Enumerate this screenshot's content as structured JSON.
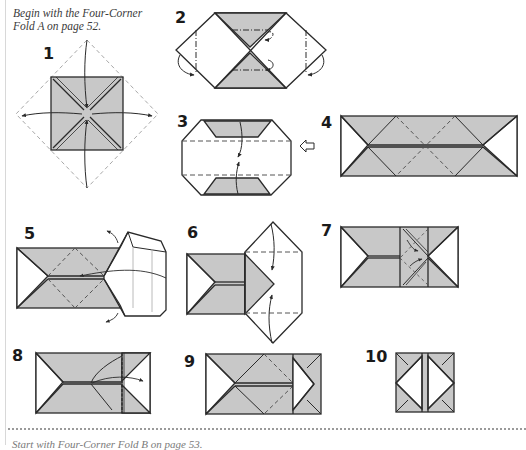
{
  "page": {
    "intro_line1": "Begin with the Four-Corner",
    "intro_line2": "Fold A on page 52.",
    "footer_text": "Start with Four-Corner Fold B on page 53."
  },
  "colors": {
    "paper_shade": "#c8c8c8",
    "line": "#2a2a2a",
    "dashed": "#555555",
    "guide": "#a8a8a8",
    "background": "#ffffff"
  },
  "steps": [
    {
      "number": "1",
      "description": "Square with diagonal creases; fold four corners to center"
    },
    {
      "number": "2",
      "description": "Hexagon shape; fold inner flaps back and side points under"
    },
    {
      "number": "3",
      "description": "Octagon; fold top and bottom edges to center"
    },
    {
      "number": "4",
      "description": "Long rectangle with diagonal crease pattern"
    },
    {
      "number": "5",
      "description": "Open and squash right end"
    },
    {
      "number": "6",
      "description": "Fold top and bottom of right section to center"
    },
    {
      "number": "7",
      "description": "Fold flaps inward along diagonals"
    },
    {
      "number": "8",
      "description": "Fold flap over to the right"
    },
    {
      "number": "9",
      "description": "Result after folding right end"
    },
    {
      "number": "10",
      "description": "Finished unit"
    }
  ],
  "icons": {
    "turn_over": "hollow-arrow-icon"
  }
}
